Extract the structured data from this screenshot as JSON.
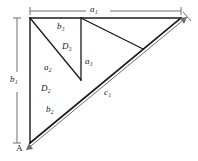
{
  "figure": {
    "vertex_labels": [
      {
        "name": "A",
        "text": "A"
      }
    ],
    "dimension_labels": [
      {
        "name": "a1",
        "base": "a",
        "sub": "1"
      },
      {
        "name": "b1",
        "base": "b",
        "sub": "1"
      },
      {
        "name": "c1",
        "base": "c",
        "sub": "1"
      }
    ],
    "region_labels": [
      {
        "name": "D2",
        "base": "D",
        "sub": "2"
      },
      {
        "name": "D3",
        "base": "D",
        "sub": "3"
      }
    ],
    "side_labels": [
      {
        "name": "a2",
        "base": "a",
        "sub": "2"
      },
      {
        "name": "b2",
        "base": "b",
        "sub": "2"
      },
      {
        "name": "a3",
        "base": "a",
        "sub": "3"
      },
      {
        "name": "b3",
        "base": "b",
        "sub": "3"
      }
    ],
    "labels": {
      "a1": "a₁",
      "b1": "b₁",
      "c1": "c₁",
      "a2": "a₂",
      "b2": "b₂",
      "a3": "a₃",
      "b3": "b₃",
      "D2": "D₂",
      "D3": "D₃",
      "A": "A"
    },
    "colors": {
      "stroke": "#1a1a1a",
      "dimension_bar": "#7a7a7a",
      "background": "#ffffff",
      "text": "#1a1a1a"
    },
    "geometry": {
      "vertex_A": [
        30,
        143
      ],
      "vertex_top_left": [
        30,
        18
      ],
      "vertex_top_right": [
        181,
        18
      ],
      "hypotenuse_mid": [
        106,
        80
      ],
      "vertical_divider_x": 81,
      "vertical_divider_bottom": [
        81,
        80
      ],
      "inner_diagonal_end": [
        143,
        49
      ],
      "a1_bar_y": 11,
      "a1_bar_x0": 30,
      "a1_bar_x1": 181,
      "b1_bar_x": 17,
      "b1_bar_y0": 18,
      "b1_bar_y1": 143,
      "c1_bar_from": [
        24,
        151
      ],
      "c1_bar_to": [
        188,
        27
      ]
    }
  }
}
